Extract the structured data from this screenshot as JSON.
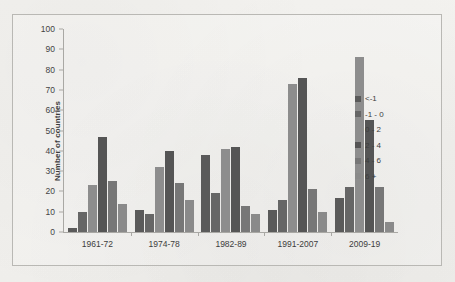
{
  "chart_data": {
    "type": "bar",
    "title": "",
    "xlabel": "",
    "ylabel": "Number of countries",
    "ylim": [
      0,
      100
    ],
    "ytick_step": 10,
    "yticks": [
      0,
      10,
      20,
      30,
      40,
      50,
      60,
      70,
      80,
      90,
      100
    ],
    "grid": false,
    "legend_position": "right",
    "categories": [
      "1961-72",
      "1974-78",
      "1982-89",
      "1991-2007",
      "2009-19"
    ],
    "series": [
      {
        "name": "<-1",
        "color": "#5a5a5a",
        "values": [
          2,
          11,
          38,
          11,
          17
        ]
      },
      {
        "name": "-1 - 0",
        "color": "#666666",
        "values": [
          10,
          9,
          19,
          16,
          22
        ]
      },
      {
        "name": "0 - 2",
        "color": "#8d8d8d",
        "values": [
          23,
          32,
          41,
          73,
          86
        ]
      },
      {
        "name": "2 - 4",
        "color": "#555555",
        "values": [
          47,
          40,
          42,
          76,
          55
        ]
      },
      {
        "name": "4 - 6",
        "color": "#777777",
        "values": [
          25,
          24,
          13,
          21,
          22
        ]
      },
      {
        "name": "6 +",
        "color": "#8a8a8a",
        "values": [
          14,
          16,
          9,
          10,
          5
        ]
      }
    ]
  },
  "legend": {
    "items": [
      {
        "label": "<-1"
      },
      {
        "label": "-1 - 0"
      },
      {
        "label": "0 - 2"
      },
      {
        "label": "2 - 4"
      },
      {
        "label": "4 - 6"
      },
      {
        "label": "6 +"
      }
    ]
  }
}
